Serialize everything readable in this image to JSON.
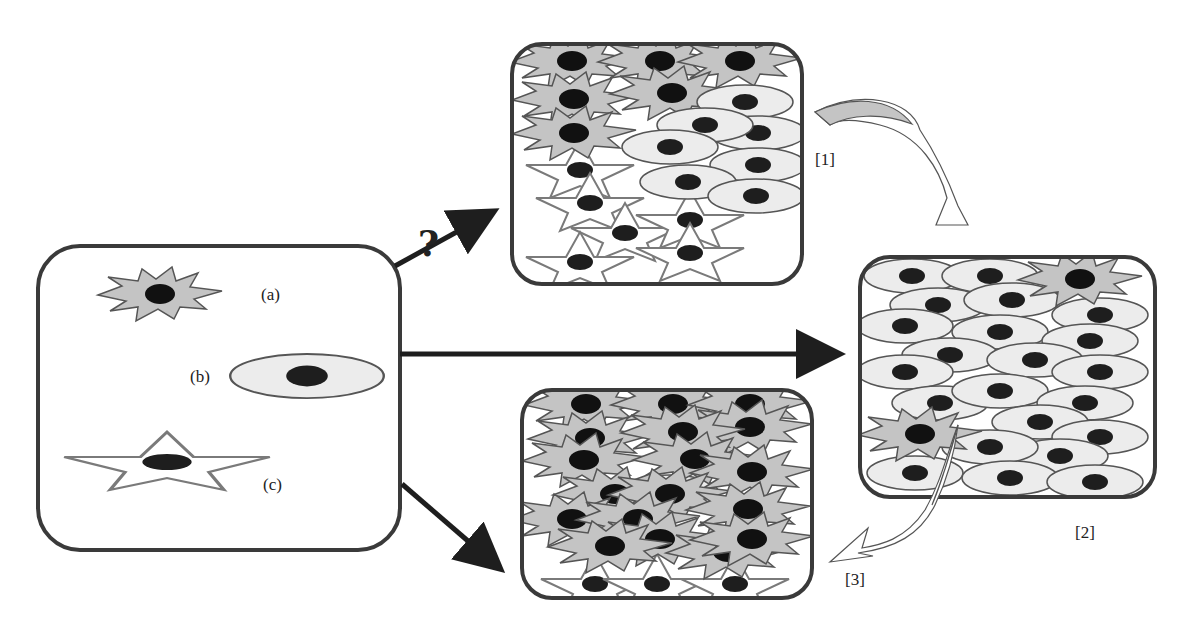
{
  "diagram": {
    "colors": {
      "frame": "#3a3a3a",
      "spiky_fill": "#c4c4c4",
      "spiky_stroke": "#555555",
      "oval_fill": "#ececec",
      "oval_stroke": "#555555",
      "star_fill": "#ffffff",
      "star_stroke": "#7a7a7a",
      "nucleus": "#1a1a1a",
      "arrow": "#1e1e1e",
      "curved_arrow_fill": "#c4c4c4"
    },
    "source_panel": {
      "cell_labels": {
        "a": "(a)",
        "b": "(b)",
        "c": "(c)"
      }
    },
    "outcome_labels": {
      "top": "[1]",
      "right": "[2]",
      "bottom": "[3]"
    },
    "uncertain_marker": "?"
  }
}
